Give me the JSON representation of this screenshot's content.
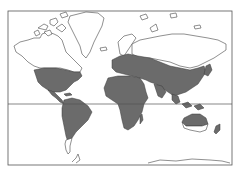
{
  "map": {
    "type": "world-distribution-map",
    "projection": "mercator",
    "frame": {
      "x": 8,
      "y": 11,
      "width": 224,
      "height": 154,
      "stroke": "#555555"
    },
    "equator": {
      "y": 104,
      "stroke": "#555555"
    },
    "colors": {
      "background": "#ffffff",
      "land_unshaded": "#ffffff",
      "land_outline": "#333333",
      "range_shading": "#6b6b6b"
    },
    "shaded_regions": [
      "southern-north-america",
      "central-america-caribbean",
      "south-america-except-patagonia",
      "africa",
      "madagascar",
      "europe",
      "middle-east",
      "central-asia",
      "south-asia",
      "east-asia",
      "southeast-asia",
      "japan",
      "australia-north",
      "new-zealand"
    ],
    "unshaded_regions": [
      "canada",
      "greenland",
      "arctic-islands",
      "northern-russia-siberia",
      "patagonia",
      "southern-australia",
      "antarctica"
    ]
  }
}
